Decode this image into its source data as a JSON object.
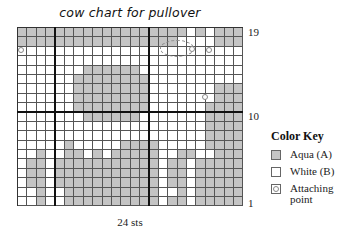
{
  "chart_data": {
    "type": "heatmap",
    "title": "cow chart for pullover",
    "xlabel": "24 sts",
    "ylabel": "",
    "columns": 24,
    "rows": 19,
    "row_tick_labels": [
      "19",
      "10",
      "1"
    ],
    "row_order": "top-to-bottom from row 19 to row 1",
    "legend": {
      "title": "Color Key",
      "entries": [
        {
          "symbol": "A",
          "label": "Aqua (A)",
          "color": "#c4c4c4"
        },
        {
          "symbol": "B",
          "label": "White (B)",
          "color": "#ffffff"
        },
        {
          "symbol": "o",
          "label": "Attaching point"
        }
      ]
    },
    "grid": [
      "AAAAAAAAAAAAAAAAAABABAAA",
      "AAAAAAAAAAAAAAAAABBBBAAA",
      "BBBBBBBBBBBBBBBBBBBBBBBB",
      "BBBBBBBBBBBBBBBBBBBBBBBB",
      "BBBBBBBAAAAAABBBBBBBBBBB",
      "BBBBBBAAAAAAAABBBBBBBBBB",
      "BBBBBBAAAAAAAABBBBBBBAAA",
      "BBBBBBAAAAAAAABBBBBBBAAA",
      "BBBBBBAAAAAAAABBBBBBAAAA",
      "BBBBBBBAAAAAABBBBBBBAAAA",
      "BBBBBBBBBBBBBBBBBBBBAAAA",
      "BBBBBBBBBBBBBBBBBBBBAAAA",
      "BBBBBABBBBBAAAABBBBBAAAA",
      "BBABBAABABAAAAABBAABBAAAA",
      "BAABAAAAAAAAAAABAABAAAAA",
      "BAABAAAAAAAAAAABAABAAAAA",
      "BAABAAAAAAAAAAABAABAAAAA",
      "BBABBAAAAAAAAAABBABAAAAA",
      "BBABBAAAAAAAAAABAABAAAAA"
    ],
    "attaching_points": [
      {
        "row": 17,
        "col": 1
      },
      {
        "row": 17,
        "col": 19
      },
      {
        "row": 17,
        "col": 21
      },
      {
        "row": 12,
        "col": 21
      }
    ],
    "thick_lines": {
      "vertical_after_cols": [
        4,
        14
      ],
      "horizontal_between_rows": [
        10,
        11
      ]
    }
  },
  "labels": {
    "title": "cow chart for pullover",
    "row_19": "19",
    "row_10": "10",
    "row_1": "1",
    "width": "24 sts",
    "key_title": "Color Key",
    "key_aqua": "Aqua (A)",
    "key_white": "White (B)",
    "key_attach": "Attaching point"
  }
}
